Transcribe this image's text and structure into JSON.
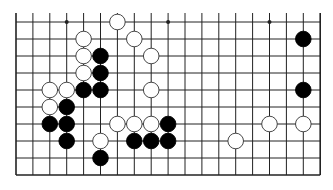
{
  "board": {
    "title": "Go board fragment",
    "columns": 19,
    "rows": 10,
    "origin_x": 16,
    "origin_y": 22,
    "spacing_x": 16.9,
    "spacing_y": 17,
    "top_open": true,
    "line_color": "#222222",
    "background": "#ffffff",
    "star_points": [
      [
        3,
        0
      ],
      [
        9,
        0
      ],
      [
        15,
        0
      ]
    ],
    "stones": [
      {
        "color": "white",
        "col": 6,
        "row": 0
      },
      {
        "color": "white",
        "col": 4,
        "row": 1
      },
      {
        "color": "white",
        "col": 7,
        "row": 1
      },
      {
        "color": "black",
        "col": 17,
        "row": 1
      },
      {
        "color": "white",
        "col": 4,
        "row": 2
      },
      {
        "color": "black",
        "col": 5,
        "row": 2
      },
      {
        "color": "white",
        "col": 8,
        "row": 2
      },
      {
        "color": "white",
        "col": 4,
        "row": 3
      },
      {
        "color": "black",
        "col": 5,
        "row": 3
      },
      {
        "color": "white",
        "col": 2,
        "row": 4
      },
      {
        "color": "white",
        "col": 3,
        "row": 4
      },
      {
        "color": "black",
        "col": 4,
        "row": 4
      },
      {
        "color": "black",
        "col": 5,
        "row": 4
      },
      {
        "color": "white",
        "col": 8,
        "row": 4
      },
      {
        "color": "black",
        "col": 17,
        "row": 4
      },
      {
        "color": "white",
        "col": 2,
        "row": 5
      },
      {
        "color": "black",
        "col": 3,
        "row": 5
      },
      {
        "color": "black",
        "col": 2,
        "row": 6
      },
      {
        "color": "black",
        "col": 3,
        "row": 6
      },
      {
        "color": "white",
        "col": 6,
        "row": 6
      },
      {
        "color": "white",
        "col": 7,
        "row": 6
      },
      {
        "color": "white",
        "col": 8,
        "row": 6
      },
      {
        "color": "black",
        "col": 9,
        "row": 6
      },
      {
        "color": "white",
        "col": 15,
        "row": 6
      },
      {
        "color": "white",
        "col": 17,
        "row": 6
      },
      {
        "color": "black",
        "col": 3,
        "row": 7
      },
      {
        "color": "white",
        "col": 5,
        "row": 7
      },
      {
        "color": "black",
        "col": 7,
        "row": 7
      },
      {
        "color": "black",
        "col": 8,
        "row": 7
      },
      {
        "color": "black",
        "col": 9,
        "row": 7
      },
      {
        "color": "white",
        "col": 13,
        "row": 7
      },
      {
        "color": "black",
        "col": 5,
        "row": 8
      }
    ]
  }
}
